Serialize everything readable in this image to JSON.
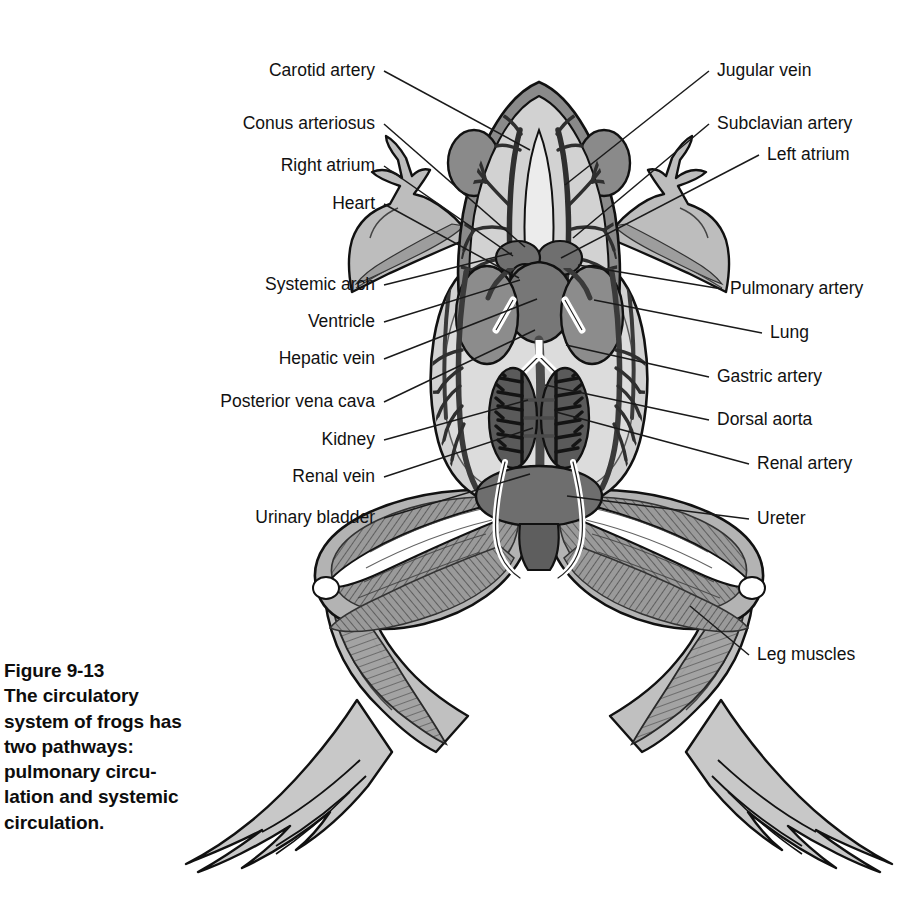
{
  "figure": {
    "number": "Figure 9-13",
    "caption_lines": [
      "Figure 9-13",
      "The circulatory",
      "system of frogs has",
      "two pathways:",
      "pulmonary circu-",
      "lation and systemic",
      "circulation."
    ],
    "caption_full": "Figure 9-13 The circulatory system of frogs has two pathways: pulmonary circulation and systemic circulation."
  },
  "colors": {
    "background": "#ffffff",
    "body_fill": "#cfcfcf",
    "body_fill_light": "#dadada",
    "organ_mid": "#8e8e8e",
    "organ_dark": "#6f6f6f",
    "organ_darkest": "#4a4a4a",
    "muscle": "#9a9a9a",
    "vessel": "#3a3a3a",
    "bone": "#ffffff",
    "outline": "#111111",
    "leader_line": "#1a1a1a",
    "text": "#111111"
  },
  "labels": {
    "left": [
      {
        "text": "Carotid artery",
        "x": 375,
        "y": 71,
        "tx": 530,
        "ty": 150
      },
      {
        "text": "Conus arteriosus",
        "x": 375,
        "y": 124,
        "tx": 525,
        "ty": 247
      },
      {
        "text": "Right atrium",
        "x": 375,
        "y": 166,
        "tx": 513,
        "ty": 256
      },
      {
        "text": "Heart",
        "x": 375,
        "y": 204,
        "tx": 519,
        "ty": 278
      },
      {
        "text": "Systemic arch",
        "x": 375,
        "y": 285,
        "tx": 512,
        "ty": 253
      },
      {
        "text": "Ventricle",
        "x": 375,
        "y": 322,
        "tx": 520,
        "ty": 280
      },
      {
        "text": "Hepatic vein",
        "x": 375,
        "y": 359,
        "tx": 537,
        "ty": 299
      },
      {
        "text": "Posterior vena cava",
        "x": 375,
        "y": 402,
        "tx": 535,
        "ty": 330
      },
      {
        "text": "Kidney",
        "x": 375,
        "y": 440,
        "tx": 528,
        "ty": 400
      },
      {
        "text": "Renal vein",
        "x": 375,
        "y": 477,
        "tx": 533,
        "ty": 428
      },
      {
        "text": "Urinary bladder",
        "x": 375,
        "y": 518,
        "tx": 530,
        "ty": 474
      }
    ],
    "right": [
      {
        "text": "Jugular vein",
        "x": 717,
        "y": 71,
        "tx": 565,
        "ty": 185
      },
      {
        "text": "Subclavian artery",
        "x": 717,
        "y": 124,
        "tx": 573,
        "ty": 238
      },
      {
        "text": "Left atrium",
        "x": 767,
        "y": 155,
        "tx": 561,
        "ty": 258
      },
      {
        "text": "Pulmonary artery",
        "x": 730,
        "y": 289,
        "tx": 578,
        "ty": 265
      },
      {
        "text": "Lung",
        "x": 770,
        "y": 333,
        "tx": 594,
        "ty": 300
      },
      {
        "text": "Gastric artery",
        "x": 717,
        "y": 377,
        "tx": 566,
        "ty": 345
      },
      {
        "text": "Dorsal aorta",
        "x": 717,
        "y": 420,
        "tx": 545,
        "ty": 385
      },
      {
        "text": "Renal artery",
        "x": 757,
        "y": 464,
        "tx": 556,
        "ty": 412
      },
      {
        "text": "Ureter",
        "x": 757,
        "y": 519,
        "tx": 567,
        "ty": 496
      },
      {
        "text": "Leg muscles",
        "x": 757,
        "y": 655,
        "tx": 690,
        "ty": 606
      }
    ]
  },
  "anatomy": {
    "structures": [
      "head",
      "eyes",
      "forelimbs",
      "hands",
      "heart",
      "left-atrium",
      "right-atrium",
      "conus-arteriosus",
      "ventricle",
      "lungs",
      "kidneys",
      "urinary-bladder",
      "ureters",
      "dorsal-aorta",
      "posterior-vena-cava",
      "carotid-artery",
      "jugular-vein",
      "subclavian-artery",
      "systemic-arch",
      "pulmonary-artery",
      "gastric-artery",
      "hepatic-vein",
      "renal-artery",
      "renal-vein",
      "hind-limbs",
      "leg-muscles",
      "webbed-feet"
    ]
  }
}
